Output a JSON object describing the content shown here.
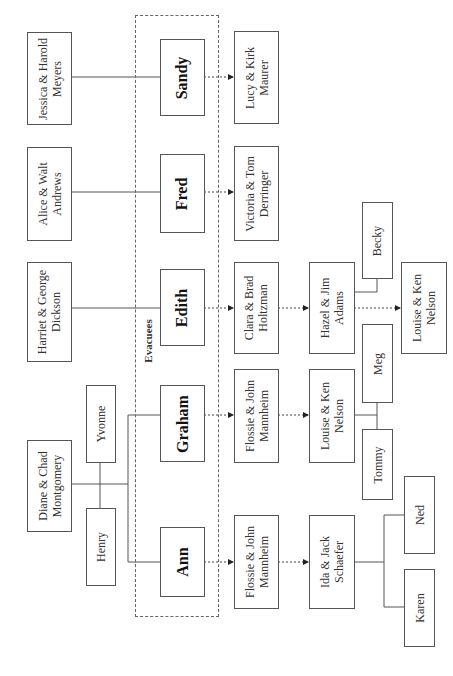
{
  "diagram": {
    "group_label": "Evacuees",
    "parents": [
      {
        "id": "p-sandy",
        "line1": "Jessica & Harold",
        "line2": "Meyers"
      },
      {
        "id": "p-fred",
        "line1": "Alice & Walt",
        "line2": "Andrews"
      },
      {
        "id": "p-edith",
        "line1": "Harriet & George",
        "line2": "Dickson"
      },
      {
        "id": "p-montgomery",
        "line1": "Diane & Chad",
        "line2": "Montgomery"
      }
    ],
    "siblings": [
      {
        "id": "yvonne",
        "label": "Yvonne"
      },
      {
        "id": "henry",
        "label": "Henry"
      }
    ],
    "evacuees": [
      {
        "id": "sandy",
        "label": "Sandy"
      },
      {
        "id": "fred",
        "label": "Fred"
      },
      {
        "id": "edith",
        "label": "Edith"
      },
      {
        "id": "graham",
        "label": "Graham"
      },
      {
        "id": "ann",
        "label": "Ann"
      }
    ],
    "hosts": [
      {
        "id": "h-sandy",
        "line1": "Lucy & Kirk",
        "line2": "Maurer"
      },
      {
        "id": "h-fred",
        "line1": "Victoria & Tom",
        "line2": "Derringer"
      },
      {
        "id": "h-edith",
        "line1": "Clara & Brad",
        "line2": "Holtzman"
      },
      {
        "id": "h-graham",
        "line1": "Flossie & John",
        "line2": "Mannheim"
      },
      {
        "id": "h-ann",
        "line1": "Flossie & John",
        "line2": "Mannheim"
      }
    ],
    "second_hosts": [
      {
        "id": "h2-edith",
        "line1": "Hazel & Jim",
        "line2": "Adams"
      },
      {
        "id": "h2-graham",
        "line1": "Louise & Ken",
        "line2": "Nelson"
      },
      {
        "id": "h2-ann",
        "line1": "Ida & Jack",
        "line2": "Schaefer"
      }
    ],
    "host_children": [
      {
        "id": "becky",
        "label": "Becky"
      },
      {
        "id": "meg",
        "label": "Meg"
      },
      {
        "id": "tommy",
        "label": "Tommy"
      },
      {
        "id": "ned",
        "label": "Ned"
      },
      {
        "id": "karen",
        "label": "Karen"
      }
    ],
    "third_hosts": [
      {
        "id": "h3-edith",
        "line1": "Louise & Ken",
        "line2": "Nelson"
      }
    ]
  }
}
